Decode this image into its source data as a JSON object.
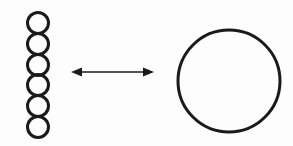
{
  "canvas": {
    "width": 293,
    "height": 146,
    "background_color": "#fdfdfd",
    "stroke_color": "#1a1a1a"
  },
  "diagram": {
    "title": "",
    "type": "schematic-equivalence"
  },
  "chain": {
    "name": "circle-chain",
    "count": 6,
    "center_x": 38,
    "radius": 10.5,
    "stroke_width": 3,
    "stroke_color": "#1a1a1a",
    "fill": "none",
    "centers_y": [
      23,
      44,
      65,
      85,
      106,
      127
    ]
  },
  "arrow": {
    "name": "double-headed-arrow",
    "x_start": 71,
    "x_end": 154,
    "y": 72,
    "stroke_width": 1.6,
    "stroke_color": "#1a1a1a",
    "head_length": 11,
    "head_half_height": 4.5,
    "heads": [
      "left",
      "right"
    ]
  },
  "big_circle": {
    "name": "large-circle",
    "center_x": 229,
    "center_y": 81,
    "radius": 51,
    "stroke_width": 3,
    "stroke_color": "#1a1a1a",
    "fill": "none"
  }
}
